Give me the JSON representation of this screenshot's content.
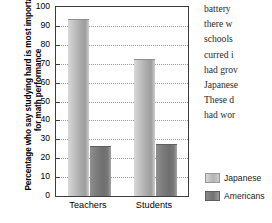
{
  "chart_data": {
    "type": "bar",
    "title": "",
    "subtitle": "",
    "xlabel": "",
    "ylabel": "Percentage who say studying hard is most important for math performance",
    "categories": [
      "Teachers",
      "Students"
    ],
    "series": [
      {
        "name": "Japanese",
        "values": [
          93,
          72
        ],
        "color": "#b4b4b4"
      },
      {
        "name": "Americans",
        "values": [
          26,
          27
        ],
        "color": "#737373"
      }
    ],
    "ylim": [
      0,
      100
    ],
    "yticks": [
      0,
      10,
      20,
      30,
      40,
      50,
      60,
      70,
      80,
      90,
      100
    ],
    "ytick_labels": [
      "0",
      "10",
      "20",
      "30",
      "40",
      "50",
      "60",
      "70",
      "80",
      "90",
      "100"
    ],
    "grid": true,
    "grid_axis": "y",
    "grid_style": "dotted",
    "legend_position": "right-bottom",
    "legend_entries": [
      "Japanese",
      "Americans"
    ],
    "annotations": []
  },
  "legend": {
    "entries": [
      {
        "label": "Japanese",
        "color": "#b4b4b4"
      },
      {
        "label": "Americans",
        "color": "#737373"
      }
    ]
  },
  "side_text": {
    "lines": [
      "battery",
      "there  w",
      "schools",
      "curred i",
      "had grov",
      "Japanese",
      "These d",
      "had wor"
    ]
  }
}
